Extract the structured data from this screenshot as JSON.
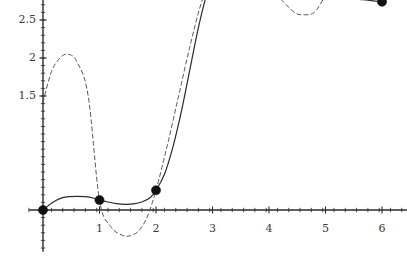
{
  "chart_data": {
    "type": "line",
    "title": "",
    "subtitle": "",
    "xlabel": "",
    "ylabel": "",
    "xlim": [
      -0.25,
      6.45
    ],
    "ylim": [
      -0.55,
      3.62
    ],
    "grid": false,
    "legend": null,
    "x_ticks_major": [
      1,
      2,
      3,
      4,
      5,
      6
    ],
    "x_tick_labels": [
      "1",
      "2",
      "3",
      "4",
      "5",
      "6"
    ],
    "x_minor_tick_step": 0.2,
    "y_ticks_major": [
      1.5,
      2,
      2.5,
      3,
      3.5
    ],
    "y_tick_labels": [
      "1.5",
      "2",
      "2.5",
      "3",
      "3.5"
    ],
    "y_minor_tick_step": 0.1,
    "axis_color": "#2b2b2b",
    "series": [
      {
        "name": "data-points",
        "type": "scatter",
        "marker": "filled-circle",
        "color": "#111111",
        "x": [
          0,
          1,
          2,
          3,
          4,
          5,
          6
        ],
        "y": [
          0.0,
          0.13,
          0.26,
          3.08,
          2.93,
          2.83,
          2.74
        ]
      },
      {
        "name": "solid-interpolant",
        "type": "line",
        "style": "solid",
        "color": "#2b2b2b",
        "x": [
          0,
          0.15,
          0.3,
          0.45,
          0.6,
          0.75,
          0.9,
          1.0,
          1.15,
          1.3,
          1.45,
          1.6,
          1.75,
          1.9,
          2.0,
          2.15,
          2.3,
          2.45,
          2.6,
          2.75,
          2.9,
          3.0,
          3.15,
          3.3,
          3.45,
          3.6,
          3.8,
          4.0,
          4.25,
          4.5,
          4.75,
          5.0,
          5.25,
          5.5,
          5.75,
          6.0
        ],
        "y": [
          0.0,
          0.09,
          0.15,
          0.175,
          0.18,
          0.175,
          0.155,
          0.13,
          0.105,
          0.085,
          0.075,
          0.08,
          0.105,
          0.165,
          0.26,
          0.47,
          0.83,
          1.3,
          1.85,
          2.4,
          2.85,
          3.08,
          3.13,
          3.12,
          3.08,
          3.04,
          2.97,
          2.93,
          2.9,
          2.875,
          2.85,
          2.83,
          2.805,
          2.78,
          2.76,
          2.74
        ]
      },
      {
        "name": "dashed-interpolant",
        "type": "line",
        "style": "dashed",
        "color": "#555555",
        "x": [
          0,
          0.15,
          0.3,
          0.44,
          0.6,
          0.8,
          1.0,
          1.2,
          1.4,
          1.54,
          1.7,
          1.85,
          2.0,
          2.2,
          2.4,
          2.6,
          2.8,
          3.0,
          3.2,
          3.4,
          3.6,
          3.8,
          4.0,
          4.2,
          4.45,
          4.6,
          4.8,
          5.0,
          5.2,
          5.4,
          5.55,
          5.7,
          5.85,
          6.0
        ],
        "y": [
          1.42,
          1.82,
          2.0,
          2.05,
          1.95,
          1.5,
          0.13,
          -0.22,
          -0.33,
          -0.34,
          -0.27,
          -0.08,
          0.26,
          0.85,
          1.5,
          2.15,
          2.72,
          3.08,
          3.16,
          3.17,
          3.08,
          3.0,
          2.93,
          2.78,
          2.6,
          2.57,
          2.6,
          2.83,
          3.15,
          3.42,
          3.49,
          3.44,
          3.2,
          2.74
        ]
      }
    ],
    "annotations": []
  }
}
